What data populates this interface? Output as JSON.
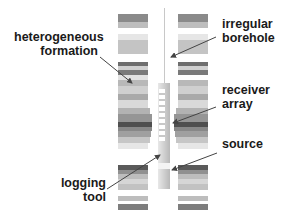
{
  "diagram": {
    "labels": {
      "heterogeneous_formation": [
        "heterogeneous",
        "formation"
      ],
      "irregular_borehole": [
        "irregular",
        "borehole"
      ],
      "receiver_array": [
        "receiver",
        "array"
      ],
      "source": [
        "source"
      ],
      "logging_tool": [
        "logging",
        "tool"
      ]
    },
    "colors": {
      "text": "#1a1a1a",
      "arrow": "#444444",
      "borehole_line": "#bbbbbb",
      "tool": "#c8c8c8"
    }
  }
}
